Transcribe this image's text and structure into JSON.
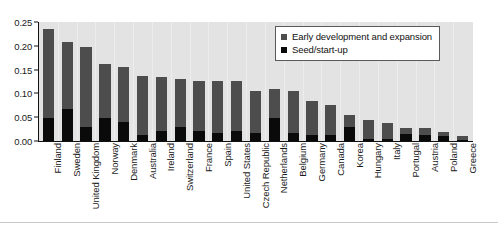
{
  "chart_data": {
    "type": "bar",
    "stacked": true,
    "title": "",
    "xlabel": "",
    "ylabel": "",
    "ylim": [
      0.0,
      0.25
    ],
    "ytick_labels": [
      "0.00",
      "0.05",
      "0.10",
      "0.15",
      "0.20",
      "0.25"
    ],
    "ytick_values": [
      0.0,
      0.05,
      0.1,
      0.15,
      0.2,
      0.25
    ],
    "grid": false,
    "legend_position": "top-right",
    "categories": [
      "Finland",
      "Sweden",
      "United Kingdom",
      "Norway",
      "Denmark",
      "Australia",
      "Ireland",
      "Switzerland",
      "France",
      "Spain",
      "United States",
      "Czech Republic",
      "Netherlands",
      "Belgium",
      "Germany",
      "Canada",
      "Korea",
      "Hungary",
      "Italy",
      "Portugal",
      "Austria",
      "Poland",
      "Greece"
    ],
    "series": [
      {
        "name": "Seed/start-up",
        "color": "#0a0a0a",
        "values": [
          0.048,
          0.067,
          0.03,
          0.048,
          0.04,
          0.013,
          0.021,
          0.03,
          0.021,
          0.017,
          0.021,
          0.017,
          0.048,
          0.017,
          0.012,
          0.012,
          0.03,
          0.004,
          0.004,
          0.015,
          0.013,
          0.01,
          0.003
        ]
      },
      {
        "name": "Early development and expansion",
        "color": "#4d4d4d",
        "values": [
          0.187,
          0.14,
          0.168,
          0.114,
          0.115,
          0.123,
          0.114,
          0.1,
          0.105,
          0.11,
          0.105,
          0.088,
          0.061,
          0.089,
          0.073,
          0.063,
          0.025,
          0.04,
          0.034,
          0.013,
          0.014,
          0.01,
          0.008
        ]
      }
    ],
    "totals": [
      0.235,
      0.207,
      0.198,
      0.162,
      0.155,
      0.136,
      0.135,
      0.13,
      0.126,
      0.127,
      0.126,
      0.105,
      0.109,
      0.106,
      0.085,
      0.075,
      0.055,
      0.044,
      0.038,
      0.028,
      0.027,
      0.02,
      0.011
    ]
  },
  "legend": {
    "items": [
      {
        "label": "Early development and expansion"
      },
      {
        "label": "Seed/start-up"
      }
    ]
  }
}
